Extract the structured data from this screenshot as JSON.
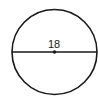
{
  "diagram": {
    "shape": "circle",
    "diameter_label": "18",
    "has_center_point": true,
    "colors": {
      "stroke": "#1a1a1a",
      "background": "#ffffff"
    }
  }
}
